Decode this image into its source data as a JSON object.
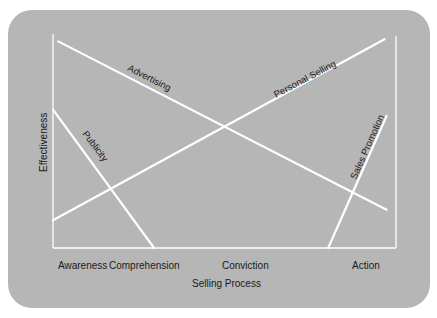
{
  "chart_data": {
    "type": "line",
    "title": "",
    "xlabel": "Selling Process",
    "ylabel": "Effectiveness",
    "categories": [
      "Awareness",
      "Comprehension",
      "Conviction",
      "Action"
    ],
    "xlim": [
      0,
      3.3
    ],
    "ylim": [
      0,
      1
    ],
    "grid": false,
    "series": [
      {
        "name": "Advertising",
        "points": [
          [
            0.05,
            0.97
          ],
          [
            3.2,
            0.18
          ]
        ]
      },
      {
        "name": "Personal Selling",
        "points": [
          [
            0.0,
            0.13
          ],
          [
            3.18,
            0.98
          ]
        ]
      },
      {
        "name": "Publicity",
        "points": [
          [
            0.0,
            0.65
          ],
          [
            0.97,
            0.0
          ]
        ]
      },
      {
        "name": "Sales Promotion",
        "points": [
          [
            2.64,
            0.0
          ],
          [
            3.2,
            0.62
          ]
        ]
      }
    ]
  },
  "colors": {
    "background": "#b6b6b6",
    "lines": "#ffffff",
    "text": "#1a1a1a"
  }
}
